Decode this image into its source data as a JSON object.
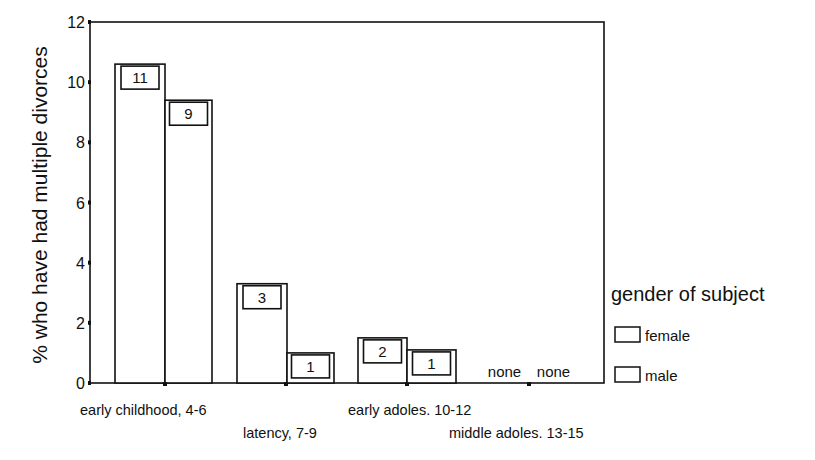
{
  "chart_data": {
    "type": "bar",
    "title": "",
    "xlabel": "",
    "ylabel": "% who have had multiple divorces",
    "ylim": [
      0,
      12
    ],
    "yticks": [
      0,
      2,
      4,
      6,
      8,
      10,
      12
    ],
    "grid": false,
    "categories": [
      "early childhood, 4-6",
      "latency, 7-9",
      "early adoles. 10-12",
      "middle adoles. 13-15"
    ],
    "series": [
      {
        "name": "female",
        "values": [
          10.6,
          3.3,
          1.5,
          0
        ],
        "counts": [
          "11",
          "3",
          "2",
          "none"
        ]
      },
      {
        "name": "male",
        "values": [
          9.4,
          1.0,
          1.1,
          0
        ],
        "counts": [
          "9",
          "1",
          "1",
          "none"
        ]
      }
    ],
    "legend": {
      "title": "gender of subject",
      "position": "right",
      "entries": [
        "female",
        "male"
      ]
    }
  }
}
